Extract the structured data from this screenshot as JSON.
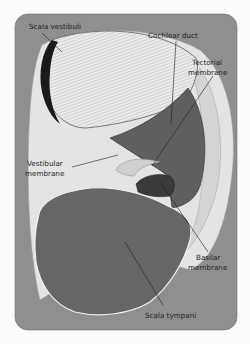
{
  "diagram": {
    "labels": {
      "scala_vestibuli": "Scala vestibuli",
      "cochlear_duct": "Cochlear duct",
      "tectorial_line1": "Tectorial",
      "tectorial_line2": "membrane",
      "vestibular_line1": "Vestibular",
      "vestibular_line2": "membrane",
      "basilar_line1": "Basilar",
      "basilar_line2": "membrane",
      "scala_tympani": "Scala tympani"
    },
    "colors": {
      "page_background": "#fbfbfb",
      "panel_background": "#8f8f8f",
      "bony_wall": "#e4e4e4",
      "scala_tympani_fill": "#666666",
      "cochlear_duct_fill": "#5f5f5f",
      "scala_vestibuli_fill": "#e9e9e9",
      "leader_line": "#1e1e1e"
    }
  }
}
